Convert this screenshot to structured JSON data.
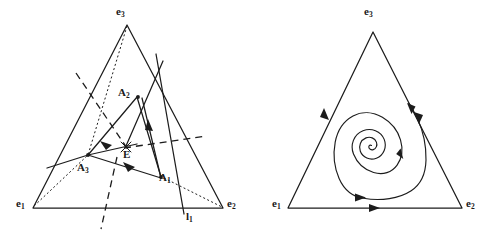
{
  "figure": {
    "type": "diagram",
    "panels": [
      {
        "id": "left",
        "name": "simplex-with-interior-construction",
        "vertex_labels": [
          {
            "name": "vertex-e1",
            "text": "e",
            "sub": "1",
            "x": 16,
            "y": 198
          },
          {
            "name": "vertex-e2",
            "text": "e",
            "sub": "2",
            "x": 227,
            "y": 198
          },
          {
            "name": "vertex-e3",
            "text": "e",
            "sub": "3",
            "x": 116,
            "y": 6
          }
        ],
        "point_labels": [
          {
            "name": "point-A1",
            "text": "A",
            "sub": "1",
            "x": 159,
            "y": 172
          },
          {
            "name": "point-A2",
            "text": "A",
            "sub": "2",
            "x": 118,
            "y": 87
          },
          {
            "name": "point-A3",
            "text": "A",
            "sub": "3",
            "x": 77,
            "y": 162
          },
          {
            "name": "point-E",
            "text": "E",
            "sub": "",
            "x": 123,
            "y": 149
          },
          {
            "name": "line-l1",
            "text": "l",
            "sub": "1",
            "x": 186,
            "y": 211
          }
        ]
      },
      {
        "id": "right",
        "name": "simplex-with-heteroclinic-spiral",
        "vertex_labels": [
          {
            "name": "vertex-e1",
            "text": "e",
            "sub": "1",
            "x": 272,
            "y": 198
          },
          {
            "name": "vertex-e2",
            "text": "e",
            "sub": "2",
            "x": 466,
            "y": 198
          },
          {
            "name": "vertex-e3",
            "text": "e",
            "sub": "3",
            "x": 364,
            "y": 6
          }
        ],
        "point_labels": []
      }
    ],
    "colors": {
      "ink": "#1c1c1c",
      "background": "#ffffff"
    }
  }
}
